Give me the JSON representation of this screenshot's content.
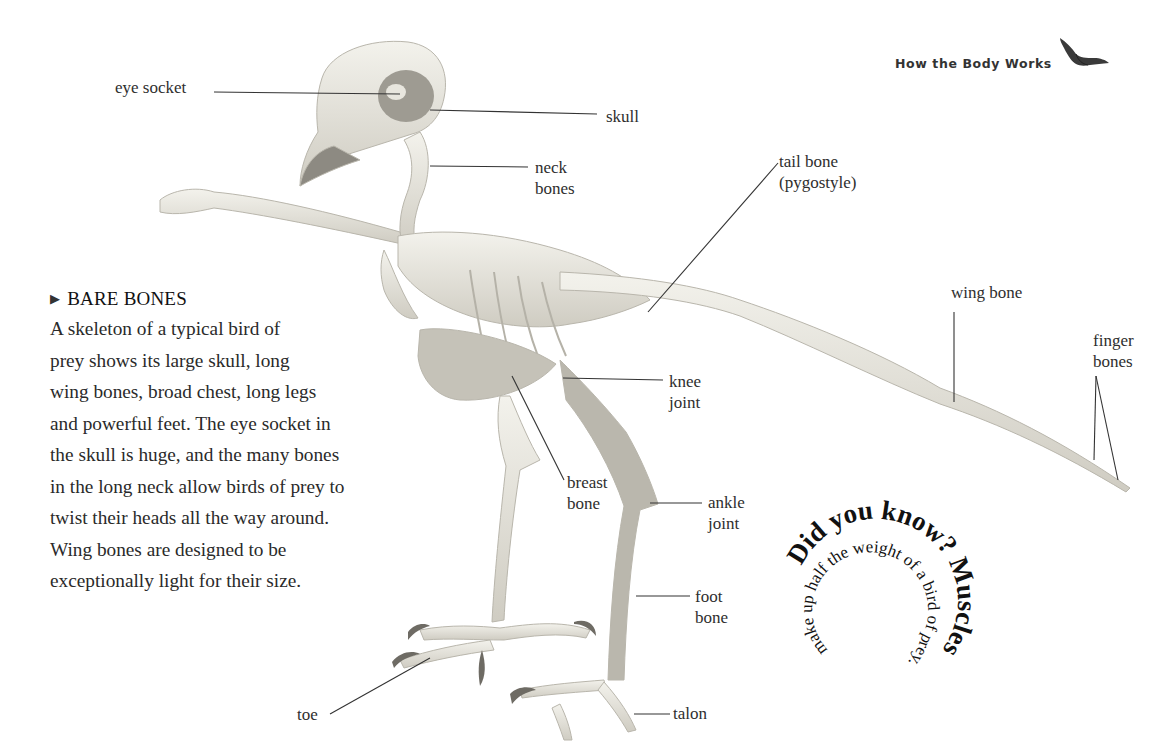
{
  "header": {
    "title": "How the Body Works",
    "icon": "soaring-bird-icon"
  },
  "labels": {
    "eye_socket": "eye socket",
    "skull": "skull",
    "neck_bones": "neck\nbones",
    "tail_bone": "tail bone\n(pygostyle)",
    "wing_bone": "wing bone",
    "finger_bones": "finger\nbones",
    "knee_joint": "knee\njoint",
    "breast_bone": "breast\nbone",
    "ankle_joint": "ankle\njoint",
    "foot_bone": "foot\nbone",
    "toe": "toe",
    "talon": "talon"
  },
  "info_box": {
    "marker": "▶",
    "title": "BARE BONES",
    "body": "A skeleton of a typical bird of\nprey shows its large skull, long\nwing bones, broad chest, long legs\nand powerful feet. The eye socket in\nthe skull is huge, and the many bones\nin the long neck allow birds of prey to\ntwist their heads all the way around.\nWing bones are designed to be\nexceptionally light for their size."
  },
  "did_you_know": {
    "heading": "Did you know?",
    "fact": "Muscles make up half the weight of a bird of prey."
  },
  "colors": {
    "bone": "#e9e7df",
    "bone_shadow": "#a9a69c",
    "text": "#2a2a2a",
    "leader_line": "#333333"
  }
}
